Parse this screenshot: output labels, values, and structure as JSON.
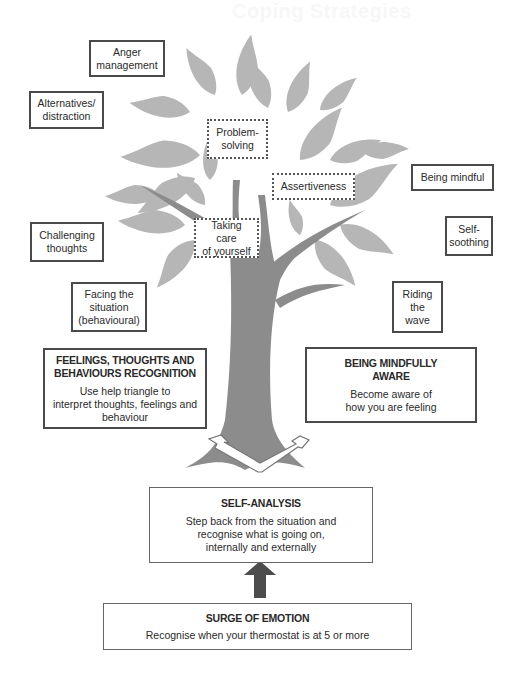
{
  "page": {
    "faded_header": "Coping Strategies"
  },
  "colors": {
    "leaf": "#b4b4b4",
    "trunk": "#8c8c8c",
    "border": "#4a4a4a",
    "arrow": "#4d4d4d"
  },
  "strategies_outside": {
    "anger_management": [
      "Anger",
      "management"
    ],
    "alternatives_distraction": [
      "Alternatives/",
      "distraction"
    ],
    "challenging_thoughts": [
      "Challenging",
      "thoughts"
    ],
    "facing_the_situation": [
      "Facing the",
      "situation",
      "(behavioural)"
    ],
    "being_mindful": [
      "Being mindful"
    ],
    "self_soothing": [
      "Self-",
      "soothing"
    ],
    "riding_the_wave": [
      "Riding",
      "the",
      "wave"
    ]
  },
  "strategies_on_tree": {
    "problem_solving": [
      "Problem-",
      "solving"
    ],
    "assertiveness": [
      "Assertiveness"
    ],
    "taking_care": [
      "Taking care",
      "of yourself"
    ]
  },
  "branches": {
    "feelings_recognition": {
      "title": [
        "FEELINGS, THOUGHTS AND",
        "BEHAVIOURS RECOGNITION"
      ],
      "description": [
        "Use help triangle to",
        "interpret thoughts, feelings and",
        "behaviour"
      ]
    },
    "mindfully_aware": {
      "title": [
        "BEING MINDFULLY",
        "AWARE"
      ],
      "description": [
        "Become aware of",
        "how you are feeling"
      ]
    }
  },
  "self_analysis": {
    "title": "SELF-ANALYSIS",
    "description": [
      "Step back from the situation and",
      "recognise what is going on,",
      "internally and externally"
    ]
  },
  "surge": {
    "title": "SURGE OF EMOTION",
    "description": "Recognise when your thermostat is at 5 or more"
  }
}
